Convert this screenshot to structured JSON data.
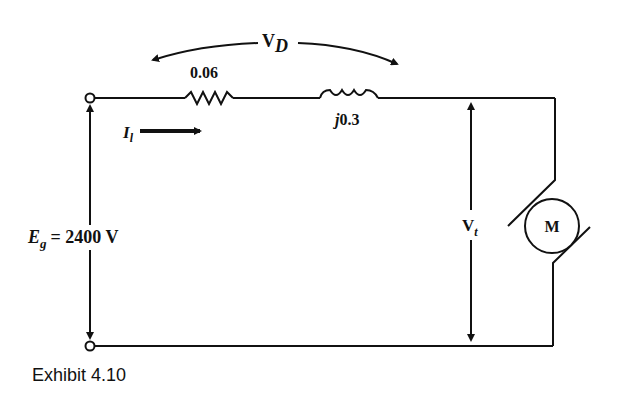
{
  "diagram": {
    "caption": "Exhibit 4.10",
    "voltage_drop": {
      "symbol": "V",
      "subscript": "D"
    },
    "resistor": {
      "value": "0.06"
    },
    "inductor": {
      "prefix": "j",
      "value": "0.3"
    },
    "current": {
      "symbol": "I",
      "subscript": "l"
    },
    "source": {
      "symbol": "E",
      "subscript": "g",
      "equals": "= 2400 V"
    },
    "terminal_voltage": {
      "symbol": "V",
      "subscript": "t"
    },
    "motor": {
      "label": "M"
    },
    "colors": {
      "line": "#111111",
      "background": "#ffffff"
    }
  }
}
